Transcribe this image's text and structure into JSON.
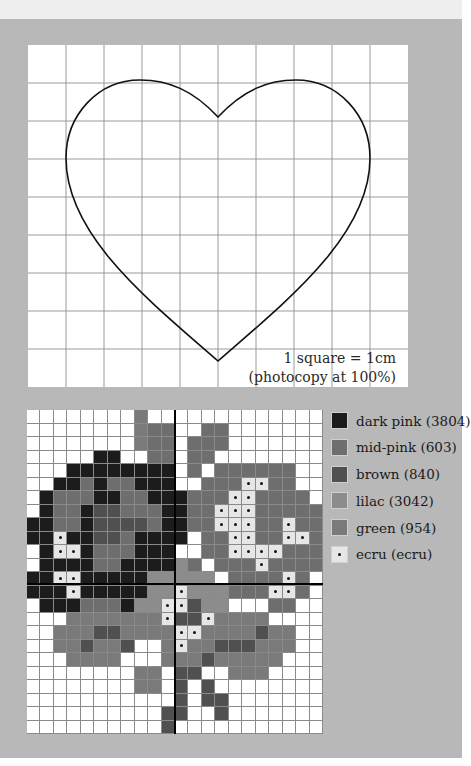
{
  "heart_template": {
    "grid_cols": 10,
    "grid_rows": 9,
    "note_line1": "1 square = 1cm",
    "note_line2": "(photocopy at 100%)"
  },
  "chart": {
    "cols": 22,
    "rows": 24,
    "colors": {
      "W": "#ffffff",
      "D": "#1c1c1c",
      "M": "#6e6e6e",
      "B": "#505050",
      "L": "#8c8c8c",
      "G": "#7a7a7a",
      "E": "#e6e6e6"
    },
    "grid": [
      "WWWWWWWWGWWWWWWWWWWWWW",
      "WWWWWWWWGMMWWMMWWWWWWW",
      "WWWWWWWWGMMWMMMWWWWWWW",
      "WWWWWDDWWMMWMMWWWWWWWW",
      "WWWDDDDDDDDWMWMMMMMMWW",
      "WWDDMDMMDDDWWMMMEEMMWW",
      "WDMMMDDMMDDDMMMEEMMMMW",
      "WDMMDBBMMMDDMMEEEMMMMM",
      "DDMMDBBBBMDDMMEEEMMEMM",
      "DDEDDBBMDDDDWMMEEMMEEM",
      "WDEEDMMMDDDWWMMEEEEMMM",
      "WDDDDMMDDDDLMWMMMEMMMM",
      "DDEEDDDDDLLLLLWMMMMEMW",
      "DDDEDDDDDLLELLLMMMEEMW",
      "WDDDMMMDLLEEBLLWWWMMWW",
      "WWWGGGGGGGEBBEGGGGWWWW",
      "WWGGGBBGGGGEEGGGGBGGWW",
      "WWGGBGGBWWGEGGBBBGGGWW",
      "WWWGGGGWWWGGGBGGGGGWWW",
      "WWWWWWWWGGWBBWWGGGWWWW",
      "WWWWWWWWGGWBWBWWWWWWWW",
      "WWWWWWWWWWWBWBBWWWWWWW",
      "WWWWWWWWWWBBWWBWWWWWWW",
      "WWWWWWWWWWBWWWWWWWWWWW"
    ]
  },
  "legend": {
    "items": [
      {
        "code": "D",
        "label": "dark pink (3804)",
        "color": "#1c1c1c"
      },
      {
        "code": "M",
        "label": "mid-pink (603)",
        "color": "#6e6e6e"
      },
      {
        "code": "B",
        "label": "brown (840)",
        "color": "#505050"
      },
      {
        "code": "L",
        "label": "lilac (3042)",
        "color": "#8c8c8c"
      },
      {
        "code": "G",
        "label": "green (954)",
        "color": "#7a7a7a"
      },
      {
        "code": "E",
        "label": "ecru (ecru)",
        "color": "#e6e6e6"
      }
    ]
  }
}
